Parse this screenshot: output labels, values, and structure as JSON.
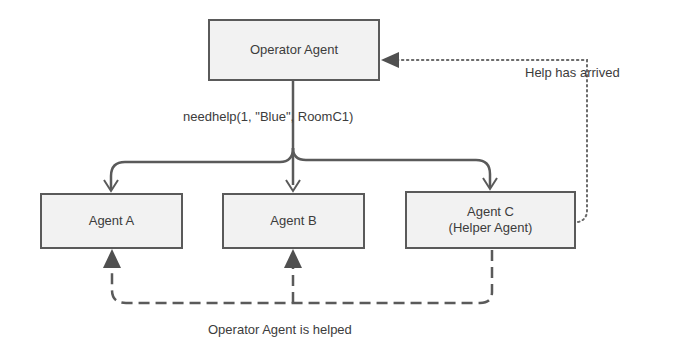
{
  "nodes": {
    "operator": {
      "label": "Operator Agent"
    },
    "agent_a": {
      "label": "Agent A"
    },
    "agent_b": {
      "label": "Agent B"
    },
    "agent_c": {
      "line1": "Agent C",
      "line2": "(Helper Agent)"
    }
  },
  "edges": {
    "broadcast": {
      "label": "needhelp(1, \"Blue\", RoomC1)",
      "style": "solid"
    },
    "help_arrived": {
      "label": "Help has arrived",
      "style": "dotted"
    },
    "helped": {
      "label": "Operator Agent is helped",
      "style": "dashed"
    }
  },
  "colors": {
    "box_fill": "#f2f2f2",
    "box_border": "#5a5a5a",
    "line": "#5a5a5a",
    "text": "#3c3c3c"
  }
}
